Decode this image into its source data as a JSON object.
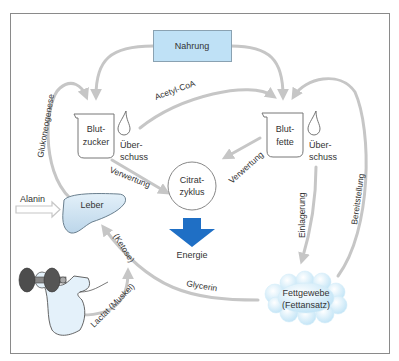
{
  "diagram": {
    "type": "metabolic-flow",
    "colors": {
      "frame": "#8a8a8a",
      "arrow": "#c6c6c6",
      "nahrung_fill": "#bfe1f6",
      "energy_arrow": "#1f6fc5",
      "liver_fill": "#d6e9f6",
      "fat_tissue_fill": "#cde9f8",
      "text": "#333333"
    },
    "nodes": {
      "nahrung": "Nahrung",
      "blutzucker_line1": "Blut-",
      "blutzucker_line2": "zucker",
      "blutfette_line1": "Blut-",
      "blutfette_line2": "fette",
      "ueberschuss_left_line1": "Über-",
      "ueberschuss_left_line2": "schuss",
      "ueberschuss_right_line1": "Über-",
      "ueberschuss_right_line2": "schuss",
      "citratzyklus_line1": "Citrat-",
      "citratzyklus_line2": "zyklus",
      "energie": "Energie",
      "leber": "Leber",
      "fettgewebe_line1": "Fettgewebe",
      "fettgewebe_line2": "(Fettansatz)",
      "muskel": "muscle with dumbbell"
    },
    "edges": {
      "acetyl_coa": "Acetyl-CoA",
      "glukoneogenese": "Glukoneogenese",
      "verwertung_left": "Verwertung",
      "verwertung_right": "Verwertung",
      "alanin": "Alanin",
      "ketose": "(Ketose)",
      "glycerin": "Glycerin",
      "lactat": "Lactat (Muskel)",
      "einlagerung": "Einlagerung",
      "bereitstellung": "Bereitstellung"
    },
    "relations": [
      {
        "from": "Nahrung",
        "to": "Blutzucker"
      },
      {
        "from": "Nahrung",
        "to": "Blutfette"
      },
      {
        "from": "Blutzucker",
        "to": "Blutfette",
        "label": "Acetyl-CoA"
      },
      {
        "from": "Blutzucker",
        "to": "Citratzyklus",
        "label": "Verwertung"
      },
      {
        "from": "Blutfette",
        "to": "Citratzyklus",
        "label": "Verwertung"
      },
      {
        "from": "Citratzyklus",
        "to": "Energie"
      },
      {
        "from": "Leber",
        "to": "Blutzucker",
        "label": "Glukoneogenese"
      },
      {
        "from": "Alanin",
        "to": "Leber"
      },
      {
        "from": "Fettgewebe",
        "to": "Leber",
        "label": "Glycerin / (Ketose)"
      },
      {
        "from": "Muskel",
        "to": "Leber",
        "label": "Lactat (Muskel)"
      },
      {
        "from": "Blutfette",
        "to": "Fettgewebe",
        "label": "Einlagerung"
      },
      {
        "from": "Fettgewebe",
        "to": "Blutfette",
        "label": "Bereitstellung"
      }
    ]
  }
}
